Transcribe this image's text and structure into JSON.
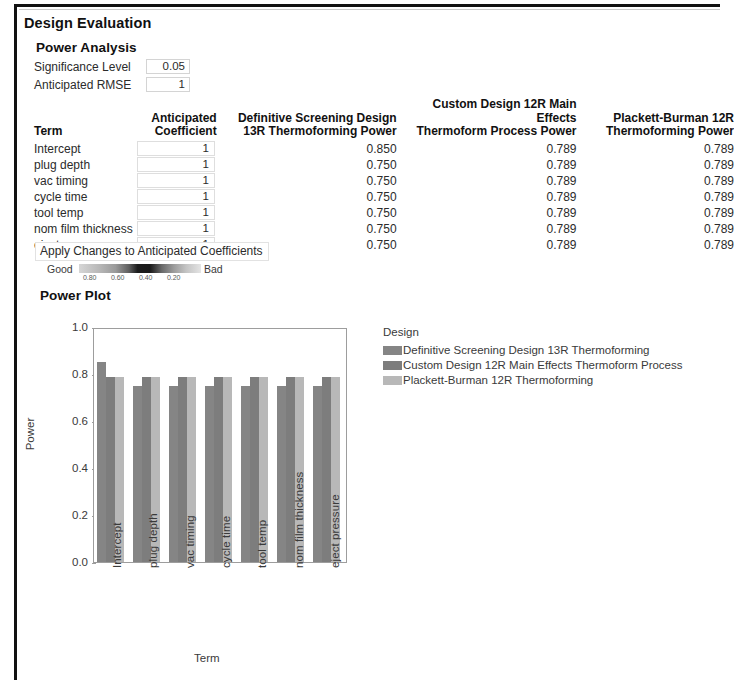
{
  "window": {
    "title": "Design Evaluation",
    "section_title": "Power Analysis",
    "plot_section_title": "Power Plot"
  },
  "params": {
    "significance_level_label": "Significance Level",
    "significance_level_value": "0.05",
    "anticipated_rmse_label": "Anticipated RMSE",
    "anticipated_rmse_value": "1"
  },
  "table": {
    "headers": {
      "term": "Term",
      "coefficient_line1": "Anticipated",
      "coefficient_line2": "Coefficient",
      "power1_line1": "Definitive Screening Design",
      "power1_line2": "13R Thermoforming Power",
      "power2_line1": "Custom Design 12R Main Effects",
      "power2_line2": "Thermoform Process Power",
      "power3_line1": "Plackett-Burman 12R",
      "power3_line2": "Thermoforming Power"
    },
    "rows": [
      {
        "term": "Intercept",
        "coefficient": "1",
        "power1": "0.850",
        "power2": "0.789",
        "power3": "0.789"
      },
      {
        "term": "plug depth",
        "coefficient": "1",
        "power1": "0.750",
        "power2": "0.789",
        "power3": "0.789"
      },
      {
        "term": "vac timing",
        "coefficient": "1",
        "power1": "0.750",
        "power2": "0.789",
        "power3": "0.789"
      },
      {
        "term": "cycle time",
        "coefficient": "1",
        "power1": "0.750",
        "power2": "0.789",
        "power3": "0.789"
      },
      {
        "term": "tool temp",
        "coefficient": "1",
        "power1": "0.750",
        "power2": "0.789",
        "power3": "0.789"
      },
      {
        "term": "nom film thickness",
        "coefficient": "1",
        "power1": "0.750",
        "power2": "0.789",
        "power3": "0.789"
      },
      {
        "term": "eject pressure",
        "coefficient": "1",
        "power1": "0.750",
        "power2": "0.789",
        "power3": "0.789"
      }
    ]
  },
  "apply_button": {
    "label": "Apply Changes to Anticipated Coefficients"
  },
  "color_legend": {
    "good_label": "Good",
    "bad_label": "Bad",
    "ticks": [
      "0.80",
      "0.60",
      "0.40",
      "0.20"
    ]
  },
  "chart_data": {
    "type": "bar",
    "title": "Power Plot",
    "xlabel": "Term",
    "ylabel": "Power",
    "ylim": [
      0.0,
      1.0
    ],
    "yticks": [
      "0.0",
      "0.2",
      "0.4",
      "0.6",
      "0.8",
      "1.0"
    ],
    "grid": false,
    "legend_position": "right",
    "legend_title": "Design",
    "categories": [
      "Intercept",
      "plug depth",
      "vac timing",
      "cycle time",
      "tool temp",
      "nom film thickness",
      "eject pressure"
    ],
    "series": [
      {
        "name": "Definitive Screening Design 13R Thermoforming",
        "color": "#858585",
        "values": [
          0.85,
          0.75,
          0.75,
          0.75,
          0.75,
          0.75,
          0.75
        ]
      },
      {
        "name": "Custom Design 12R Main Effects Thermoform Process",
        "color": "#7d7d7d",
        "values": [
          0.789,
          0.789,
          0.789,
          0.789,
          0.789,
          0.789,
          0.789
        ]
      },
      {
        "name": "Plackett-Burman 12R Thermoforming",
        "color": "#b8b8b8",
        "values": [
          0.789,
          0.789,
          0.789,
          0.789,
          0.789,
          0.789,
          0.789
        ]
      }
    ]
  }
}
